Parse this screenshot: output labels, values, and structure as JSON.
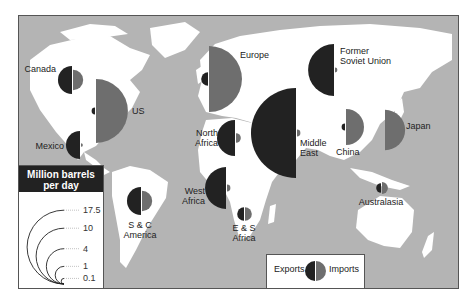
{
  "chart_data": {
    "type": "map-semicircle",
    "title": "",
    "units": "Million barrels per day",
    "size_legend": {
      "title_line1": "Million barrels",
      "title_line2": "per day",
      "values": [
        "17.5",
        "10",
        "4",
        "1",
        "0.1"
      ]
    },
    "key_legend": {
      "exports_label": "Exports",
      "imports_label": "Imports"
    },
    "colors": {
      "exports": "#222222",
      "imports": "#6e6e6e",
      "sea": "#b4b4b4",
      "land": "#ffffff",
      "frame": "#555555"
    },
    "regions": [
      {
        "name": "Canada",
        "label_lines": [
          "Canada"
        ],
        "exports": 1.7,
        "imports": 0.9,
        "cx": 72,
        "cy": 80,
        "label_x": 56,
        "label_y": 72,
        "anchor": "end"
      },
      {
        "name": "US",
        "label_lines": [
          "US"
        ],
        "exports": 0.1,
        "imports": 8.8,
        "cx": 95,
        "cy": 111,
        "label_x": 132,
        "label_y": 114,
        "anchor": "start"
      },
      {
        "name": "Mexico",
        "label_lines": [
          "Mexico"
        ],
        "exports": 1.7,
        "imports": 0.03,
        "cx": 80,
        "cy": 145,
        "label_x": 64,
        "label_y": 149,
        "anchor": "end"
      },
      {
        "name": "S & C America",
        "label_lines": [
          "S & C",
          "America"
        ],
        "exports": 1.7,
        "imports": 0.9,
        "cx": 141,
        "cy": 201,
        "label_x": 140,
        "label_y": 228,
        "anchor": "middle"
      },
      {
        "name": "Europe",
        "label_lines": [
          "Europe"
        ],
        "exports": 0.4,
        "imports": 9.4,
        "cx": 208,
        "cy": 79,
        "label_x": 240,
        "label_y": 58,
        "anchor": "start"
      },
      {
        "name": "North Africa",
        "label_lines": [
          "North",
          "Africa"
        ],
        "exports": 2.8,
        "imports": 0.2,
        "cx": 235,
        "cy": 138,
        "label_x": 218,
        "label_y": 136,
        "anchor": "end"
      },
      {
        "name": "West Africa",
        "label_lines": [
          "West",
          "Africa"
        ],
        "exports": 3.8,
        "imports": 0.1,
        "cx": 226,
        "cy": 188,
        "label_x": 205,
        "label_y": 194,
        "anchor": "end"
      },
      {
        "name": "E & S Africa",
        "label_lines": [
          "E & S",
          "Africa"
        ],
        "exports": 0.4,
        "imports": 0.4,
        "cx": 244,
        "cy": 214,
        "label_x": 244,
        "label_y": 231,
        "anchor": "middle"
      },
      {
        "name": "Middle East",
        "label_lines": [
          "Middle",
          "East"
        ],
        "exports": 17.5,
        "imports": 0.1,
        "cx": 296,
        "cy": 133,
        "label_x": 300,
        "label_y": 146,
        "anchor": "start"
      },
      {
        "name": "Former Soviet Union",
        "label_lines": [
          "Former",
          "Soviet Union"
        ],
        "exports": 5.8,
        "imports": 0.05,
        "cx": 334,
        "cy": 70,
        "label_x": 340,
        "label_y": 54,
        "anchor": "start"
      },
      {
        "name": "China",
        "label_lines": [
          "China"
        ],
        "exports": 0.1,
        "imports": 2.8,
        "cx": 345,
        "cy": 127,
        "label_x": 336,
        "label_y": 155,
        "anchor": "start"
      },
      {
        "name": "Japan",
        "label_lines": [
          "Japan"
        ],
        "exports": 0.0,
        "imports": 3.5,
        "cx": 384,
        "cy": 130,
        "label_x": 406,
        "label_y": 129,
        "anchor": "start"
      },
      {
        "name": "Australasia",
        "label_lines": [
          "Australasia"
        ],
        "exports": 0.2,
        "imports": 0.3,
        "cx": 381,
        "cy": 188,
        "label_x": 381,
        "label_y": 205,
        "anchor": "middle"
      }
    ],
    "scale_px_per_sqrt_unit": 10.76
  }
}
